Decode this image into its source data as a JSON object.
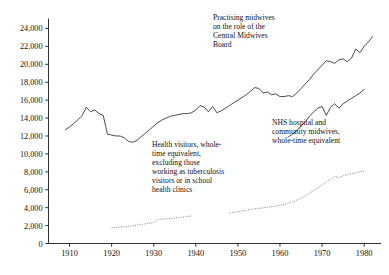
{
  "chart_data": {
    "type": "line",
    "title": "",
    "xlabel": "",
    "ylabel": "",
    "xlim": [
      1905,
      1984
    ],
    "ylim": [
      0,
      25000
    ],
    "grid": false,
    "legend_position": "inline-annotations",
    "xticks": [
      1910,
      1920,
      1930,
      1940,
      1950,
      1960,
      1970,
      1980
    ],
    "xtick_labels": [
      "1910",
      "1920",
      "1930",
      "1940",
      "1950",
      "1960",
      "1970",
      "1980"
    ],
    "yticks": [
      0,
      2000,
      4000,
      6000,
      8000,
      10000,
      12000,
      14000,
      16000,
      18000,
      20000,
      22000,
      24000
    ],
    "ytick_labels": [
      "0",
      "2,000",
      "4,000",
      "6,000",
      "8,000",
      "10,000",
      "12,000",
      "14,000",
      "16,000",
      "18,000",
      "20,000",
      "22,000",
      "24,000"
    ],
    "series": [
      {
        "name": "Practising midwives on the role of the Central Midwives Board",
        "style": "solid",
        "color": "#2b2b2b",
        "x": [
          1909,
          1910,
          1911,
          1912,
          1913,
          1914,
          1915,
          1916,
          1917,
          1918,
          1919,
          1920,
          1921,
          1922,
          1923,
          1924,
          1925,
          1926,
          1927,
          1928,
          1929,
          1930,
          1931,
          1932,
          1933,
          1934,
          1935,
          1936,
          1937,
          1938,
          1939,
          1940,
          1941,
          1942,
          1943,
          1944,
          1945,
          1946,
          1947,
          1948,
          1949,
          1950,
          1951,
          1952,
          1953,
          1954,
          1955,
          1956,
          1957,
          1958,
          1959,
          1960,
          1961,
          1962,
          1963,
          1964,
          1965,
          1966,
          1967,
          1968,
          1969,
          1970,
          1971,
          1972,
          1973,
          1974,
          1975,
          1976,
          1977,
          1978,
          1979,
          1980,
          1981,
          1982
        ],
        "y": [
          12700,
          13000,
          13400,
          13800,
          14300,
          15200,
          14700,
          14900,
          14500,
          14300,
          12200,
          12100,
          12000,
          12000,
          11800,
          11400,
          11300,
          11500,
          11900,
          12300,
          12700,
          13100,
          13500,
          13800,
          14000,
          14200,
          14300,
          14400,
          14500,
          14500,
          14600,
          14900,
          15400,
          15200,
          14700,
          15300,
          14600,
          14800,
          15100,
          15400,
          15700,
          16000,
          16300,
          16600,
          17000,
          17400,
          17300,
          16800,
          16900,
          16600,
          16700,
          16400,
          16400,
          16500,
          16400,
          16800,
          17300,
          17800,
          18300,
          18900,
          19400,
          19900,
          20400,
          20300,
          20100,
          20500,
          20600,
          20300,
          20700,
          21700,
          21300,
          22000,
          22500,
          23100
        ]
      },
      {
        "name": "NHS hospital and community midwives, whole-time equivalent",
        "style": "solid",
        "color": "#2b2b2b",
        "x": [
          1962,
          1963,
          1964,
          1965,
          1966,
          1967,
          1968,
          1969,
          1970,
          1971,
          1972,
          1973,
          1974,
          1975,
          1976,
          1977,
          1978,
          1979,
          1980
        ],
        "y": [
          11900,
          12200,
          12600,
          13100,
          13600,
          14200,
          14700,
          15100,
          15300,
          14300,
          15200,
          15600,
          15100,
          15600,
          15900,
          16200,
          16500,
          16800,
          17200
        ]
      },
      {
        "name": "Health visitors, whole-time equivalent, excluding those working as tuberculosis visitors or in school health clinics",
        "style": "dotted",
        "color": "#6e6e6e",
        "x": [
          1920,
          1921,
          1922,
          1923,
          1924,
          1925,
          1926,
          1927,
          1928,
          1929,
          1930,
          1931,
          1932,
          1933,
          1934,
          1935,
          1936,
          1937,
          1938,
          1939,
          1948,
          1949,
          1950,
          1951,
          1952,
          1953,
          1954,
          1955,
          1956,
          1957,
          1958,
          1959,
          1960,
          1961,
          1962,
          1963,
          1964,
          1965,
          1966,
          1967,
          1968,
          1969,
          1970,
          1971,
          1972,
          1973,
          1974,
          1975,
          1976,
          1977,
          1978,
          1979,
          1980
        ],
        "y": [
          1780,
          1800,
          1830,
          1870,
          1920,
          1980,
          2050,
          2120,
          2190,
          2260,
          2340,
          2680,
          2720,
          2760,
          2800,
          2850,
          2900,
          2960,
          3020,
          3080,
          3400,
          3480,
          3560,
          3640,
          3720,
          3800,
          3860,
          3920,
          3980,
          4040,
          4100,
          4180,
          4260,
          4360,
          4480,
          4640,
          4840,
          5080,
          5340,
          5620,
          5920,
          6220,
          6520,
          6850,
          7150,
          7500,
          7350,
          7550,
          7700,
          7800,
          7900,
          8000,
          8100
        ]
      }
    ],
    "annotations": [
      {
        "id": "practising",
        "text": "Practising midwives\non the role of the\nCentral Midwives\nBoard"
      },
      {
        "id": "nhs",
        "text": "NHS hospital and\ncommunity midwives,\nwhole-time equivalent"
      },
      {
        "id": "health_visitors",
        "text": "Health visitors, whole-\ntime equivalent,\nexcluding those\nworking as tuberculosis\nvisitors or in school\nhealth clinics"
      }
    ]
  }
}
